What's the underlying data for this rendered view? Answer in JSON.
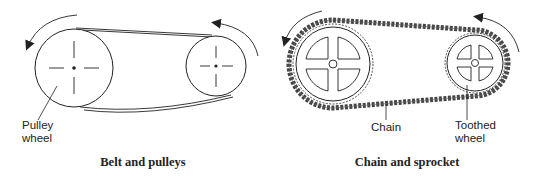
{
  "belt_diagram": {
    "caption": "Belt and pulleys",
    "labels": {
      "pulley_line1": "Pulley",
      "pulley_line2": "wheel"
    },
    "rotation": "counter-clockwise"
  },
  "chain_diagram": {
    "caption": "Chain and sprocket",
    "labels": {
      "chain": "Chain",
      "toothed_line1": "Toothed",
      "toothed_line2": "wheel"
    },
    "rotation": "counter-clockwise"
  },
  "colors": {
    "line": "#222222",
    "background": "#ffffff"
  }
}
